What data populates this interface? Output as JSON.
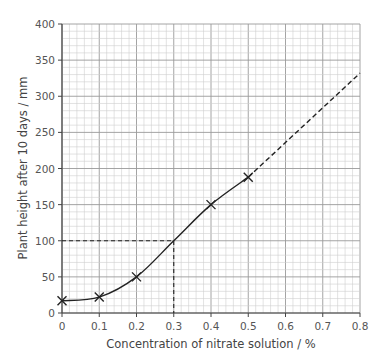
{
  "chart_data": {
    "type": "line",
    "title": "",
    "xlabel": "Concentration of nitrate solution / %",
    "ylabel": "Plant height after 10 days / mm",
    "xlim": [
      0,
      0.8
    ],
    "ylim": [
      0,
      400
    ],
    "x_ticks": [
      "0",
      "0.1",
      "0.2",
      "0.3",
      "0.4",
      "0.5",
      "0.6",
      "0.7",
      "0.8"
    ],
    "y_ticks": [
      "0",
      "50",
      "100",
      "150",
      "200",
      "250",
      "300",
      "350",
      "400"
    ],
    "grid": true,
    "series": [
      {
        "name": "Measured",
        "marker": "x",
        "x": [
          0,
          0.1,
          0.2,
          0.4,
          0.5
        ],
        "y": [
          17,
          22,
          50,
          150,
          188
        ]
      }
    ],
    "extrapolation": {
      "style": "dashed",
      "from": [
        0.5,
        188
      ],
      "to": [
        0.8,
        332
      ]
    },
    "annotations": [
      {
        "type": "dashed-guide",
        "description": "Reading at 100 mm",
        "x": 0.3,
        "y": 100
      }
    ]
  }
}
